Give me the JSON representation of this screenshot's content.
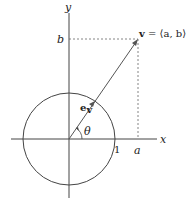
{
  "diagram": {
    "axes": {
      "x_label": "x",
      "y_label": "y"
    },
    "tick_labels": {
      "one": "1",
      "a": "a",
      "b": "b"
    },
    "vector_label": {
      "bold": "v",
      "rest": " = ⟨a, b⟩"
    },
    "unit_vector_label": {
      "main": "e",
      "sub": "v"
    },
    "angle_label": "θ",
    "colors": {
      "stroke": "#444444",
      "dashed": "#666666",
      "background": "#ffffff"
    }
  }
}
